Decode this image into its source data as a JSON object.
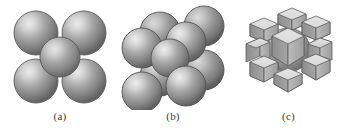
{
  "figure": {
    "title": "Body-centered cubic (BCC) crystal structure representations",
    "background_color": "#ffffff",
    "sphere_color": "#8f8f8f",
    "sphere_highlight_color": "#e2e2e2",
    "sphere_shadow_color": "#555555",
    "outline_color": "#4a4a4a",
    "caption_color": "#3a3a3a"
  },
  "panels": [
    {
      "id": "a",
      "label": "(a)",
      "name": "hard-sphere-unit-cell",
      "description": "Hard-sphere unit cell representation: four corner atoms and one body-center atom",
      "sphere_count": 5,
      "spheres": [
        {
          "cx": 36,
          "cy": 33,
          "r": 22,
          "z": 1
        },
        {
          "cx": 84,
          "cy": 33,
          "r": 22,
          "z": 1
        },
        {
          "cx": 60,
          "cy": 57,
          "r": 20,
          "z": 2
        },
        {
          "cx": 36,
          "cy": 81,
          "r": 22,
          "z": 3
        },
        {
          "cx": 84,
          "cy": 81,
          "r": 22,
          "z": 3
        }
      ]
    },
    {
      "id": "b",
      "label": "(b)",
      "name": "reduced-sphere-unit-cell",
      "description": "Reduced-sphere three dimensional unit cell: eight corner atoms and one body-center atom",
      "sphere_count": 9,
      "spheres": [
        {
          "cx": 48,
          "cy": 32,
          "r": 20,
          "z": 1
        },
        {
          "cx": 92,
          "cy": 26,
          "r": 20,
          "z": 2
        },
        {
          "cx": 30,
          "cy": 48,
          "r": 20,
          "z": 3
        },
        {
          "cx": 74,
          "cy": 42,
          "r": 20,
          "z": 4
        },
        {
          "cx": 58,
          "cy": 58,
          "r": 19,
          "z": 5
        },
        {
          "cx": 48,
          "cy": 76,
          "r": 20,
          "z": 6
        },
        {
          "cx": 92,
          "cy": 70,
          "r": 20,
          "z": 7
        },
        {
          "cx": 30,
          "cy": 92,
          "r": 20,
          "z": 8
        },
        {
          "cx": 74,
          "cy": 86,
          "r": 20,
          "z": 9
        }
      ]
    },
    {
      "id": "c",
      "label": "(c)",
      "name": "aggregate-unit-cell",
      "description": "Unit cell showing one-eighth sphere fragments at the eight corners and a whole sphere at the body center",
      "corner_fragment_count": 8,
      "center_sphere_count": 1
    }
  ]
}
